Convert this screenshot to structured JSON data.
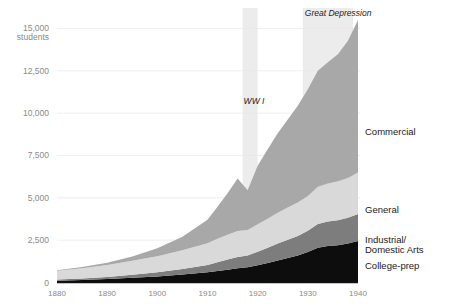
{
  "chart_data": {
    "type": "area",
    "stacked": true,
    "title": "",
    "subtitle": "",
    "xlabel": "",
    "ylabel": "students",
    "xlim": [
      1880,
      1940
    ],
    "ylim": [
      0,
      15500
    ],
    "grid": true,
    "legend_position": "inline-right",
    "x_ticks": [
      "1880",
      "1890",
      "1900",
      "1910",
      "1920",
      "1930",
      "1940"
    ],
    "y_ticks": [
      "0",
      "2,500",
      "5,000",
      "7,500",
      "10,000",
      "12,500",
      "15,000"
    ],
    "y_top_unit": "students",
    "x": [
      1880,
      1885,
      1890,
      1895,
      1900,
      1905,
      1910,
      1912,
      1914,
      1916,
      1918,
      1920,
      1922,
      1924,
      1926,
      1928,
      1930,
      1932,
      1934,
      1936,
      1938,
      1940
    ],
    "series": [
      {
        "name": "College-prep",
        "color": "#0d0d0d",
        "values": [
          110,
          150,
          200,
          280,
          360,
          470,
          600,
          680,
          760,
          840,
          900,
          1020,
          1150,
          1300,
          1450,
          1600,
          1800,
          2050,
          2150,
          2200,
          2300,
          2450
        ]
      },
      {
        "name": "Industrial/Domestic Arts",
        "color": "#7d7d7d",
        "values": [
          60,
          90,
          130,
          180,
          240,
          330,
          440,
          520,
          600,
          660,
          700,
          800,
          900,
          1000,
          1080,
          1150,
          1250,
          1400,
          1450,
          1480,
          1520,
          1600
        ]
      },
      {
        "name": "General",
        "color": "#d9d9d9",
        "values": [
          520,
          600,
          700,
          820,
          950,
          1100,
          1280,
          1380,
          1460,
          1540,
          1500,
          1620,
          1720,
          1820,
          1900,
          1980,
          2060,
          2200,
          2250,
          2300,
          2350,
          2450
        ]
      },
      {
        "name": "Commercial",
        "color": "#a8a8a8",
        "values": [
          40,
          70,
          130,
          260,
          470,
          800,
          1380,
          1900,
          2450,
          3100,
          2350,
          3450,
          4100,
          4700,
          5200,
          5700,
          6300,
          6850,
          7150,
          7500,
          8100,
          9000
        ]
      }
    ],
    "annotations": [
      {
        "name": "ww1",
        "label": "WW I",
        "x_start": 1917,
        "x_end": 1920,
        "shade": "#ececec"
      },
      {
        "name": "great-depression",
        "label": "Great Depression",
        "x_start": 1929,
        "x_end": 1939,
        "shade": "#ececec"
      }
    ]
  }
}
